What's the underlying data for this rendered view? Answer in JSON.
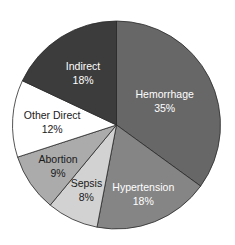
{
  "chart_data": {
    "type": "pie",
    "title": "",
    "start_angle": "12 o'clock",
    "direction": "clockwise",
    "slices": [
      {
        "label": "Hemorrhage",
        "value": 35,
        "value_label": "35%",
        "color": "#676767",
        "text_color": "#ffffff"
      },
      {
        "label": "Hypertension",
        "value": 18,
        "value_label": "18%",
        "color": "#858585",
        "text_color": "#ffffff"
      },
      {
        "label": "Sepsis",
        "value": 8,
        "value_label": "8%",
        "color": "#d2d2d2",
        "text_color": "#1a1a1a"
      },
      {
        "label": "Abortion",
        "value": 9,
        "value_label": "9%",
        "color": "#ababab",
        "text_color": "#1a1a1a"
      },
      {
        "label": "Other Direct",
        "value": 12,
        "value_label": "12%",
        "color": "#ffffff",
        "text_color": "#1a1a1a"
      },
      {
        "label": "Indirect",
        "value": 18,
        "value_label": "18%",
        "color": "#3c3c3c",
        "text_color": "#ffffff"
      }
    ],
    "legend": "none"
  }
}
